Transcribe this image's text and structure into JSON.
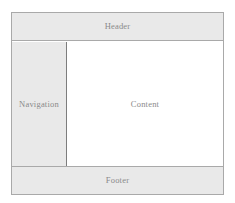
{
  "diagram": {
    "regions": {
      "header": {
        "label": "Header"
      },
      "navigation": {
        "label": "Navigation"
      },
      "content": {
        "label": "Content"
      },
      "footer": {
        "label": "Footer"
      }
    },
    "colors": {
      "band_fill": "#e9e9e9",
      "content_fill": "#ffffff",
      "border": "#a9a9a9",
      "divider": "#7d7d7d",
      "text": "#8a8a8a"
    }
  }
}
